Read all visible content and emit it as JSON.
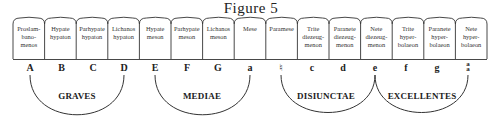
{
  "title": "Figure 5",
  "boxes": [
    {
      "label": "Proslam-\nbano-\nmenos",
      "letter": "A"
    },
    {
      "label": "Hypate\nhypaton",
      "letter": "B"
    },
    {
      "label": "Parhypate\nhypaton",
      "letter": "C"
    },
    {
      "label": "Lichanos\nhypaton",
      "letter": "D"
    },
    {
      "label": "Hypate\nmeson",
      "letter": "E"
    },
    {
      "label": "Parhypate\nmeson",
      "letter": "F"
    },
    {
      "label": "Lichanos\nmeson",
      "letter": "G"
    },
    {
      "label": "Mese",
      "letter": "a"
    },
    {
      "label": "Paramese",
      "letter": "♮"
    },
    {
      "label": "Trite\ndiezeug-\nmenon",
      "letter": "c"
    },
    {
      "label": "Paranete\ndiezeug-\nmenon",
      "letter": "d"
    },
    {
      "label": "Nete\ndiezeug-\nmenon",
      "letter": "e"
    },
    {
      "label": "Trite\nhyper-\nbolaeon",
      "letter": "f"
    },
    {
      "label": "Paranete\nhyper-\nbolaeon",
      "letter": "g"
    },
    {
      "label": "Nete\nhyper-\nbolaeon",
      "letter": "aa"
    }
  ],
  "groups": [
    {
      "label": "GRAVES",
      "from": 0,
      "to": 3
    },
    {
      "label": "MEDIAE",
      "from": 4,
      "to": 7
    },
    {
      "label": "DISIUNCTAE",
      "from": 8,
      "to": 11
    },
    {
      "label": "EXCELLENTES",
      "from": 11,
      "to": 14
    }
  ],
  "colors": {
    "ink": "#222222",
    "box_stroke": "#333333",
    "background": "#ffffff"
  }
}
